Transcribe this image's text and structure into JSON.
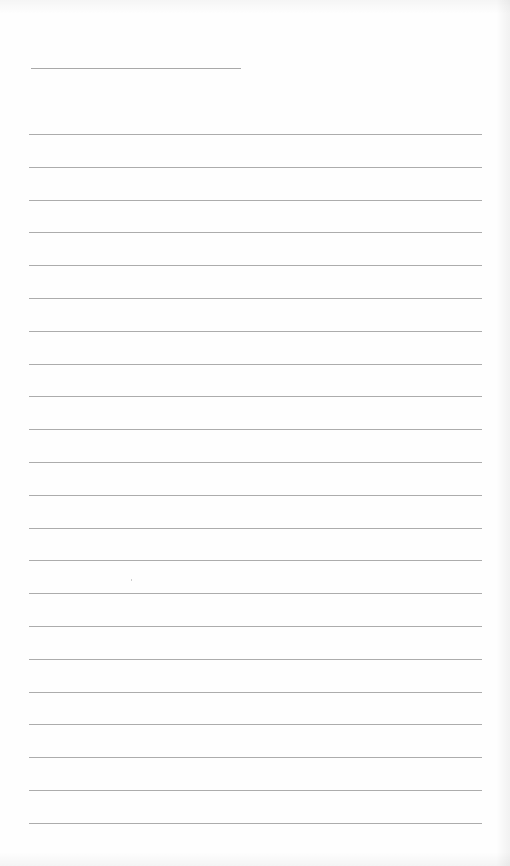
{
  "page": {
    "type": "blank lined paper",
    "background_color": "#fefefe",
    "line_color": "#acacac"
  },
  "title_line": {
    "label": ""
  },
  "rules": {
    "count": 22,
    "first_y": 134,
    "spacing": 32.8,
    "lines": [
      "",
      "",
      "",
      "",
      "",
      "",
      "",
      "",
      "",
      "",
      "",
      "",
      "",
      "",
      "",
      "",
      "",
      "",
      "",
      "",
      "",
      ""
    ]
  }
}
